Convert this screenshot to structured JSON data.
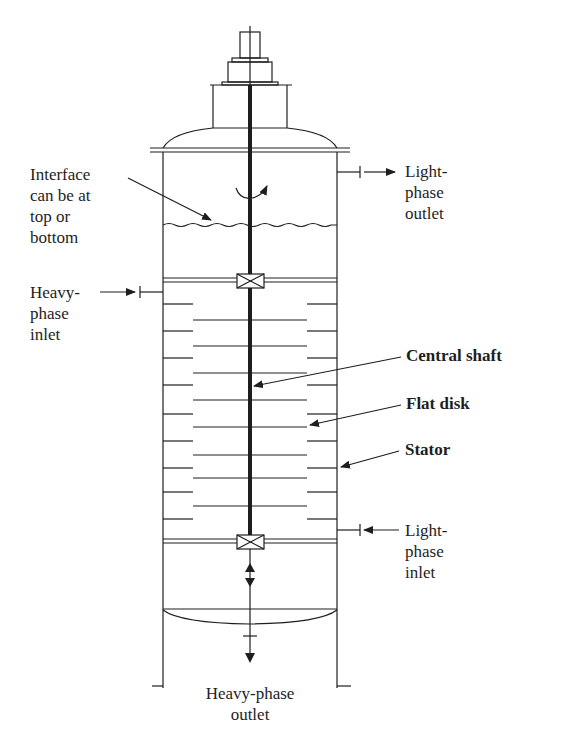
{
  "diagram": {
    "colors": {
      "line": "#1e1e1e",
      "background": "#ffffff"
    },
    "labels": {
      "interface_note": [
        "Interface",
        "can be at",
        "top or",
        "bottom"
      ],
      "light_phase_outlet": [
        "Light-",
        "phase",
        "outlet"
      ],
      "heavy_phase_inlet": [
        "Heavy-",
        "phase",
        "inlet"
      ],
      "central_shaft": "Central shaft",
      "flat_disk": "Flat disk",
      "stator": "Stator",
      "light_phase_inlet": [
        "Light-",
        "phase",
        "inlet"
      ],
      "heavy_phase_outlet": [
        "Heavy-phase",
        "outlet"
      ]
    },
    "components": {
      "shaft_x": 250,
      "wall_left_x": 163,
      "wall_right_x": 337,
      "disk_extent_x": [
        193,
        307
      ],
      "stator_y": [
        304,
        331,
        358,
        385,
        414,
        441,
        468,
        492,
        519
      ],
      "disk_y": [
        320,
        346,
        373,
        400,
        427,
        455,
        478,
        506
      ],
      "upper_plate_y": 280,
      "lower_plate_y": 541,
      "disk_count": 8,
      "stator_count": 9
    }
  }
}
